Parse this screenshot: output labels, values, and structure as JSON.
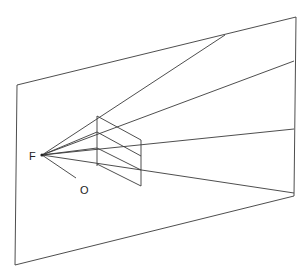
{
  "diagram": {
    "title": "",
    "labels": {
      "focal_point": "F",
      "observer": "O"
    },
    "picture_plane": {
      "corners": [
        [
          17,
          85
        ],
        [
          296,
          17
        ],
        [
          294,
          196
        ],
        [
          15,
          265
        ]
      ]
    },
    "focal_point": [
      42,
      155
    ],
    "observer_line": [
      [
        42,
        155
      ],
      [
        78,
        180
      ]
    ],
    "rays": [
      [
        [
          42,
          155
        ],
        [
          225,
          35
        ]
      ],
      [
        [
          42,
          155
        ],
        [
          294,
          61
        ]
      ],
      [
        [
          42,
          155
        ],
        [
          294,
          129
        ]
      ],
      [
        [
          42,
          155
        ],
        [
          294,
          193
        ]
      ]
    ],
    "prism": {
      "near_edge": [
        [
          97,
          116
        ],
        [
          97,
          166
        ]
      ],
      "far_edge": [
        [
          141,
          140
        ],
        [
          141,
          186
        ]
      ],
      "cross_lines": [
        [
          [
            97,
            116
          ],
          [
            141,
            140
          ]
        ],
        [
          [
            97,
            132
          ],
          [
            141,
            156
          ]
        ],
        [
          [
            97,
            148
          ],
          [
            141,
            170
          ]
        ],
        [
          [
            97,
            164
          ],
          [
            141,
            186
          ]
        ]
      ]
    },
    "stroke_color": "#3a3a3a",
    "background_color": "#ffffff"
  }
}
